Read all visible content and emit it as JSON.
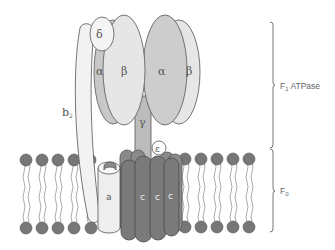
{
  "diagram": {
    "colors": {
      "outline": "#555555",
      "alpha_fill": "#c8c8c8",
      "beta_fill": "#e6e6e6",
      "delta_fill": "#f4f4f4",
      "b2_fill": "#f2f2f2",
      "gamma_fill": "#bcbcbc",
      "epsilon_fill": "#ffffff",
      "c_ring_fill": "#7a7a7a",
      "a_fill": "#eeeeee",
      "lipid_head": "#777777",
      "lipid_tail": "#888888"
    },
    "subunits": {
      "delta": "δ",
      "alpha_left": "α",
      "beta_left": "β",
      "alpha_right": "α",
      "beta_right": "β",
      "gamma": "γ",
      "epsilon": "ε",
      "b2": "b",
      "b2_sub": "2",
      "a": "a",
      "c1": "c",
      "c2": "c",
      "c3": "c"
    },
    "regions": {
      "f1": {
        "label": "F",
        "sub": "1",
        "suffix": " ATPase"
      },
      "f0": {
        "label": "F",
        "sub": "0"
      }
    }
  }
}
